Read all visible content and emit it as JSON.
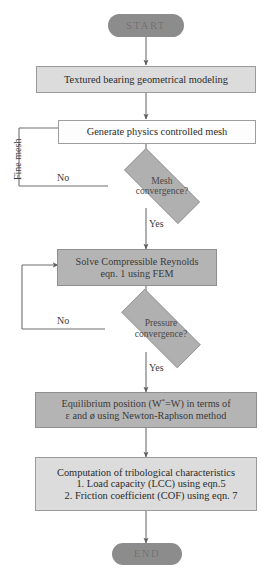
{
  "diagram": {
    "colors": {
      "terminal_fill": "#8c8c8c",
      "process_light_fill": "#dcdcdc",
      "process_plain_fill": "#fdfdfd",
      "process_dark_fill": "#b4b4b4",
      "decision_fill": "#b0b0b0",
      "line": "#6e6e6e",
      "text": "#2b2b2b"
    },
    "nodes": {
      "start": {
        "label": "START",
        "type": "terminal"
      },
      "geometry": {
        "label": "Textured bearing geometrical modeling",
        "type": "process"
      },
      "mesh": {
        "label": "Generate physics controlled mesh",
        "type": "process"
      },
      "mesh_decision": {
        "type": "decision",
        "line1": "Mesh",
        "line2": "convergence?"
      },
      "reynolds": {
        "type": "process",
        "line1": "Solve Compressible Reynolds",
        "line2": "eqn. 1 using FEM"
      },
      "pressure_decision": {
        "type": "decision",
        "line1": "Pressure",
        "line2": "convergence?"
      },
      "equilibrium": {
        "type": "process",
        "line1_pre": "Equilibrium position (W",
        "line1_sup": "*",
        "line1_post": "=W) in terms of",
        "line2": "ε  and ø   using  Newton-Raphson method"
      },
      "computation": {
        "type": "process",
        "line1": "Computation of tribological characteristics",
        "line2": "1. Load capacity (LCC) using eqn.5",
        "line3": "2. Friction coefficient (COF) using eqn. 7"
      },
      "end": {
        "label": "END",
        "type": "terminal"
      }
    },
    "edge_labels": {
      "mesh_no": "No",
      "mesh_yes": "Yes",
      "pressure_no": "No",
      "pressure_yes": "Yes",
      "fine_mesh": "Fine mesh"
    }
  }
}
